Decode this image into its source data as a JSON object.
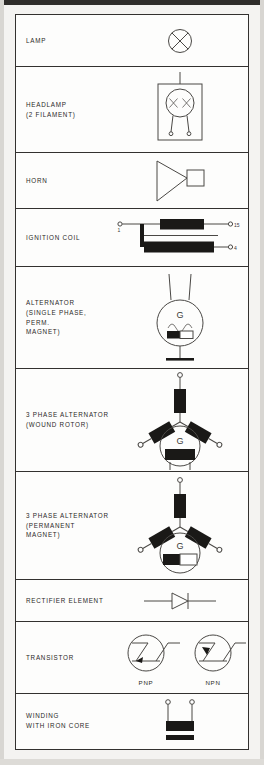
{
  "document": {
    "type": "automotive electrical symbol reference table",
    "row_count": 10
  },
  "rows": [
    {
      "label": "LAMP",
      "symbol": "lamp-circle-with-x",
      "captions": []
    },
    {
      "label": "HEADLAMP\n(2 FILAMENT)",
      "symbol": "headlamp-two-filament",
      "captions": []
    },
    {
      "label": "HORN",
      "symbol": "horn-triangle-with-square",
      "captions": []
    },
    {
      "label": "IGNITION COIL",
      "symbol": "ignition-coil",
      "captions": [],
      "terminals": [
        "1",
        "15",
        "4"
      ]
    },
    {
      "label": "ALTERNATOR\n(SINGLE PHASE, PERM.\nMAGNET)",
      "symbol": "alternator-single-phase-permanent-magnet",
      "captions": [],
      "machine_letter": "G"
    },
    {
      "label": "3 PHASE ALTERNATOR\n(WOUND ROTOR)",
      "symbol": "three-phase-alternator-wound-rotor",
      "captions": [],
      "machine_letter": "G"
    },
    {
      "label": "3 PHASE ALTERNATOR\n(PERMANENT MAGNET)",
      "symbol": "three-phase-alternator-permanent-magnet",
      "captions": [],
      "machine_letter": "G"
    },
    {
      "label": "RECTIFIER ELEMENT",
      "symbol": "diode-rectifier",
      "captions": []
    },
    {
      "label": "TRANSISTOR",
      "symbol": "transistor-pair",
      "captions": [
        "PNP",
        "NPN"
      ]
    },
    {
      "label": "WINDING\nWITH IRON CORE",
      "symbol": "winding-with-iron-core",
      "captions": []
    }
  ],
  "colors": {
    "ink": "#1a1917",
    "line": "#4a4845",
    "border": "#33312f",
    "paper": "#fdfdfc",
    "scan_background": "#f4f3f1"
  }
}
